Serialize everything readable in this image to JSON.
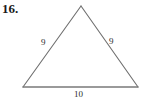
{
  "problem": {
    "number": "16."
  },
  "figure": {
    "shape_name": "isosceles-triangle",
    "stroke_color": "#6f6f6f",
    "background_color": "#ffffff",
    "labels": {
      "left_side": "9",
      "right_side": "9",
      "base": "10"
    },
    "vertices": {
      "apex": [
        81,
        6
      ],
      "bottom_left": [
        23,
        87
      ],
      "bottom_right": [
        138,
        87
      ]
    }
  }
}
